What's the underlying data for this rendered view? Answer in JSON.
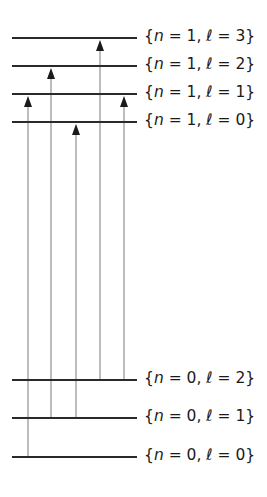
{
  "diagram": {
    "type": "energy-level-diagram",
    "levels": [
      {
        "id": "n1l3",
        "label": "{n = 1, ℓ = 3}",
        "n": 1,
        "l": 3,
        "y": 38
      },
      {
        "id": "n1l2",
        "label": "{n = 1, ℓ = 2}",
        "n": 1,
        "l": 2,
        "y": 66
      },
      {
        "id": "n1l1",
        "label": "{n = 1, ℓ = 1}",
        "n": 1,
        "l": 1,
        "y": 94
      },
      {
        "id": "n1l0",
        "label": "{n = 1, ℓ = 0}",
        "n": 1,
        "l": 0,
        "y": 122
      },
      {
        "id": "n0l2",
        "label": "{n = 0, ℓ = 2}",
        "n": 0,
        "l": 2,
        "y": 380
      },
      {
        "id": "n0l1",
        "label": "{n = 0, ℓ = 1}",
        "n": 0,
        "l": 1,
        "y": 418
      },
      {
        "id": "n0l0",
        "label": "{n = 0, ℓ = 0}",
        "n": 0,
        "l": 0,
        "y": 457
      }
    ],
    "transitions": [
      {
        "x": 28,
        "from": "n0l0",
        "to": "n1l1"
      },
      {
        "x": 51,
        "from": "n0l1",
        "to": "n1l2"
      },
      {
        "x": 76,
        "from": "n0l1",
        "to": "n1l0"
      },
      {
        "x": 100,
        "from": "n0l2",
        "to": "n1l3"
      },
      {
        "x": 124,
        "from": "n0l2",
        "to": "n1l1"
      }
    ],
    "line_x_start": 12,
    "line_x_end": 137,
    "colors": {
      "level": "#2a2a2a",
      "transition": "#7a7a7a",
      "arrowhead": "#1a1a1a"
    }
  }
}
